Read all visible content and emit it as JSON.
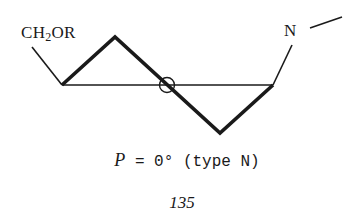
{
  "diagram": {
    "type": "ring-conformation",
    "substituents": {
      "left": {
        "prefix": "CH",
        "subscript": "2",
        "suffix": "OR"
      },
      "right": {
        "atom": "N"
      }
    },
    "center_marker": "circle-at-ring-midpoint",
    "caption": {
      "variable": "P",
      "equals": " = 0° (type N)"
    },
    "compound_number": "135"
  },
  "colors": {
    "stroke": "#1a1a1a",
    "background": "#ffffff"
  }
}
